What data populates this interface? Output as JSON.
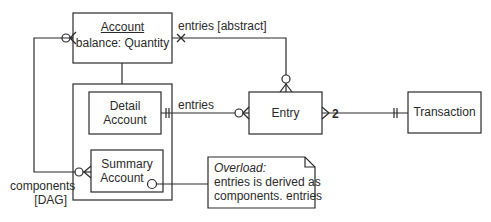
{
  "diagram": {
    "type": "ER / type diagram",
    "entities": {
      "account": {
        "name": "Account",
        "attribute": "balance: Quantity"
      },
      "detail_account": {
        "line1": "Detail",
        "line2": "Account"
      },
      "summary_account": {
        "line1": "Summary",
        "line2": "Account"
      },
      "entry": {
        "name": "Entry"
      },
      "transaction": {
        "name": "Transaction"
      }
    },
    "relationships": {
      "account_entries": {
        "label": "entries [abstract]"
      },
      "detail_entries": {
        "label": "entries"
      },
      "entry_transaction": {
        "cardinality": "2"
      },
      "components": {
        "line1": "components",
        "line2": "[DAG]"
      }
    },
    "note": {
      "title": "Overload:",
      "line1": "entries is derived as",
      "line2": "components. entries"
    },
    "colors": {
      "line": "#2a2a2a",
      "background": "#ffffff"
    }
  }
}
